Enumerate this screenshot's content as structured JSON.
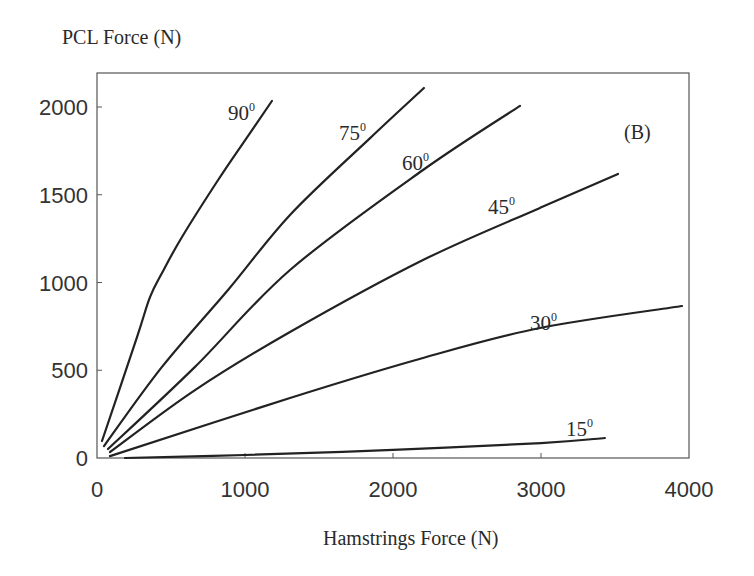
{
  "chart_data": {
    "type": "line",
    "title": "",
    "panel_label": "(B)",
    "xlabel": "Hamstrings Force (N)",
    "ylabel": "PCL Force (N)",
    "xlim": [
      0,
      4000
    ],
    "ylim": [
      0,
      2200
    ],
    "xticks": [
      0,
      1000,
      2000,
      3000,
      4000
    ],
    "yticks": [
      0,
      500,
      1000,
      1500,
      2000
    ],
    "xtick_labels": [
      "0",
      "1000",
      "2000",
      "3000",
      "4000"
    ],
    "ytick_labels": [
      "0",
      "500",
      "1000",
      "1500",
      "2000"
    ],
    "grid": false,
    "legend": "inline curve labels (knee flexion angle)",
    "series": [
      {
        "name": "90°",
        "label_main": "90",
        "label_sup": "0",
        "points": [
          [
            34,
            97
          ],
          [
            270,
            689
          ],
          [
            358,
            917
          ],
          [
            439,
            1054
          ],
          [
            574,
            1259
          ],
          [
            818,
            1584
          ],
          [
            1000,
            1810
          ],
          [
            1182,
            2034
          ]
        ]
      },
      {
        "name": "75°",
        "label_main": "75",
        "label_sup": "0",
        "points": [
          [
            47,
            68
          ],
          [
            439,
            519
          ],
          [
            885,
            957
          ],
          [
            1304,
            1385
          ],
          [
            1845,
            1823
          ],
          [
            2209,
            2108
          ]
        ]
      },
      {
        "name": "60°",
        "label_main": "60",
        "label_sup": "0",
        "points": [
          [
            74,
            51
          ],
          [
            662,
            519
          ],
          [
            1304,
            1071
          ],
          [
            2203,
            1641
          ],
          [
            2858,
            2006
          ]
        ]
      },
      {
        "name": "45°",
        "label_main": "45",
        "label_sup": "0",
        "points": [
          [
            88,
            34
          ],
          [
            662,
            387
          ],
          [
            1304,
            718
          ],
          [
            2203,
            1128
          ],
          [
            2993,
            1425
          ],
          [
            3520,
            1618
          ]
        ]
      },
      {
        "name": "30°",
        "label_main": "30",
        "label_sup": "0",
        "points": [
          [
            88,
            11
          ],
          [
            1304,
            342
          ],
          [
            2203,
            570
          ],
          [
            2993,
            741
          ],
          [
            3953,
            866
          ]
        ]
      },
      {
        "name": "15°",
        "label_main": "15",
        "label_sup": "0",
        "points": [
          [
            189,
            0
          ],
          [
            1000,
            17
          ],
          [
            2000,
            46
          ],
          [
            3000,
            85
          ],
          [
            3432,
            114
          ]
        ]
      }
    ]
  }
}
